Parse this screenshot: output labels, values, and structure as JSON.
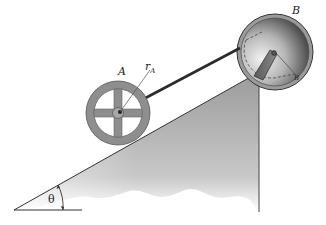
{
  "diagram": {
    "type": "mechanics-figure",
    "labels": {
      "wheel": "A",
      "wheel_radius": "r",
      "wheel_radius_sub": "A",
      "spool": "B",
      "spool_radius": "r",
      "spool_radius_sub": "B",
      "angle": "θ"
    },
    "colors": {
      "incline_fill": "#a9a9a9",
      "wheel": "#8e8e8e",
      "spool_dark": "#3a3a3a",
      "cord": "#2b2b2b",
      "lines": "#333333"
    }
  }
}
